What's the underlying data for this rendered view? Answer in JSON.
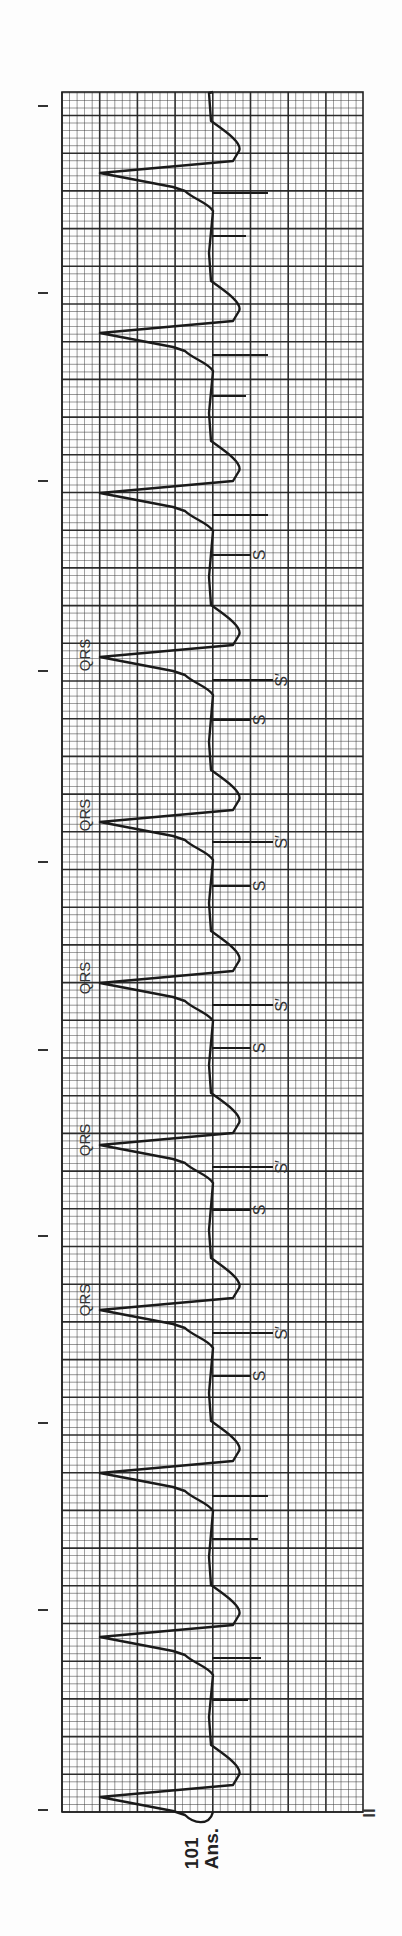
{
  "figure": {
    "number": "101",
    "caption_suffix": "Ans.",
    "lead_label": "II",
    "annotation_labels": {
      "qrs": "QRS",
      "s": "S",
      "s_prime": "S′"
    }
  },
  "colors": {
    "paper": "#fdfdfd",
    "grid_minor": "#3a3a3a",
    "grid_major": "#222222",
    "trace": "#1a1a1a",
    "text": "#333333"
  },
  "chart_data": {
    "type": "line",
    "xlabel": "time (bottom to top)",
    "ylabel": "amplitude (leftward = negative)",
    "grid": true,
    "grid_spec": {
      "small_box_px": 7.54,
      "big_box_px": 37.7,
      "columns_big": 8
    },
    "time_markers_y": [
      106,
      293,
      481,
      671,
      862,
      1050,
      1236,
      1423,
      1610,
      1810
    ],
    "baseline_x": 213,
    "qrs_y": [
      173,
      333,
      493,
      657,
      822,
      983,
      1145,
      1310,
      1473,
      1637,
      1797
    ],
    "qrs_depth_x": 100,
    "pacer_spikes": [
      {
        "y": 193,
        "len": 55
      },
      {
        "y": 236,
        "len": 33
      },
      {
        "y": 355,
        "len": 55
      },
      {
        "y": 396,
        "len": 33
      },
      {
        "y": 515,
        "len": 55
      },
      {
        "y": 555,
        "len": 38,
        "label": "S"
      },
      {
        "y": 680,
        "len": 60,
        "label": "S′"
      },
      {
        "y": 720,
        "len": 38,
        "label": "S"
      },
      {
        "y": 842,
        "len": 60,
        "label": "S′"
      },
      {
        "y": 886,
        "len": 38,
        "label": "S"
      },
      {
        "y": 1005,
        "len": 60,
        "label": "S′"
      },
      {
        "y": 1048,
        "len": 38,
        "label": "S"
      },
      {
        "y": 1167,
        "len": 60,
        "label": "S′"
      },
      {
        "y": 1210,
        "len": 38,
        "label": "S"
      },
      {
        "y": 1333,
        "len": 60,
        "label": "S′"
      },
      {
        "y": 1376,
        "len": 38,
        "label": "S"
      },
      {
        "y": 1496,
        "len": 55
      },
      {
        "y": 1539,
        "len": 45
      },
      {
        "y": 1658,
        "len": 48
      },
      {
        "y": 1700,
        "len": 35
      }
    ],
    "qrs_labels_y": [
      1280,
      1115,
      955,
      790,
      630
    ],
    "approx_heart_rate_bpm": 70
  }
}
